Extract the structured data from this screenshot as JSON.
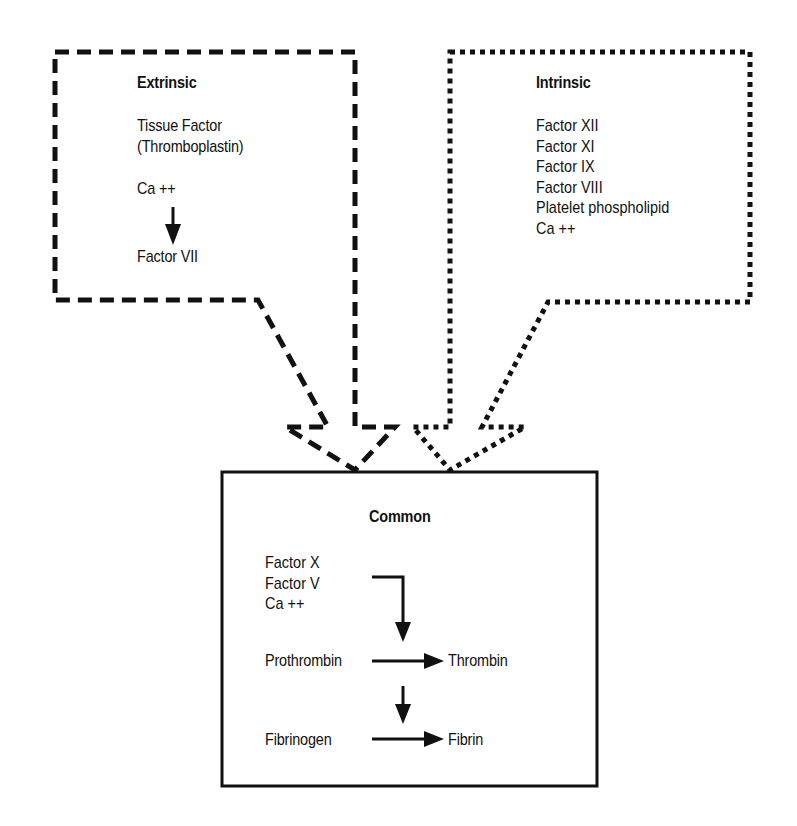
{
  "diagram": {
    "extrinsic": {
      "title": "Extrinsic",
      "items": [
        "Tissue Factor",
        "(Thromboplastin)",
        "Ca ++",
        "Factor  VII"
      ],
      "border_style": "dashed"
    },
    "intrinsic": {
      "title": "Intrinsic",
      "items": [
        "Factor XII",
        "Factor XI",
        "Factor IX",
        "Factor VIII",
        "Platelet phospholipid",
        "Ca ++"
      ],
      "border_style": "dotted"
    },
    "common": {
      "title": "Common",
      "cofactors": [
        "Factor X",
        "Factor V",
        "Ca ++"
      ],
      "step1_from": "Prothrombin",
      "step1_to": "Thrombin",
      "step2_from": "Fibrinogen",
      "step2_to": "Fibrin",
      "border_style": "solid"
    },
    "colors": {
      "line": "#111111",
      "background": "#ffffff"
    }
  }
}
